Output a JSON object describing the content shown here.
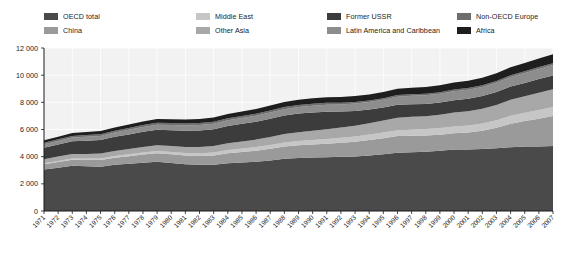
{
  "legend": {
    "items": [
      {
        "label": "OECD total",
        "color": "#4a4a4a",
        "col": 0,
        "row": 0
      },
      {
        "label": "China",
        "color": "#9a9a9a",
        "col": 0,
        "row": 1
      },
      {
        "label": "Middle East",
        "color": "#c6c6c6",
        "col": 1,
        "row": 0
      },
      {
        "label": "Other Asia",
        "color": "#a8a8a8",
        "col": 1,
        "row": 1
      },
      {
        "label": "Former USSR",
        "color": "#3c3c3c",
        "col": 2,
        "row": 0
      },
      {
        "label": "Latin America and Caribbean",
        "color": "#8d8d8d",
        "col": 2,
        "row": 1
      },
      {
        "label": "Non-OECD Europe",
        "color": "#6e6e6e",
        "col": 3,
        "row": 0
      },
      {
        "label": "Africa",
        "color": "#1e1e1e",
        "col": 3,
        "row": 1
      }
    ]
  },
  "chart_data": {
    "type": "area",
    "title": "",
    "xlabel": "",
    "ylabel": "",
    "stacked": true,
    "grid": true,
    "legend_position": "top",
    "ylim": [
      0,
      12000
    ],
    "yticks": [
      0,
      2000,
      4000,
      6000,
      8000,
      10000,
      12000
    ],
    "ytick_labels": [
      "0",
      "2 000",
      "4 000",
      "6 000",
      "8 000",
      "10 000",
      "12 000"
    ],
    "categories": [
      "1971",
      "1972",
      "1973",
      "1974",
      "1975",
      "1976",
      "1977",
      "1978",
      "1979",
      "1980",
      "1981",
      "1982",
      "1983",
      "1984",
      "1985",
      "1986",
      "1987",
      "1988",
      "1989",
      "1990",
      "1991",
      "1992",
      "1993",
      "1994",
      "1995",
      "1996",
      "1997",
      "1998",
      "1999",
      "2000",
      "2001",
      "2002",
      "2003",
      "2004",
      "2005",
      "2006",
      "2007"
    ],
    "series": [
      {
        "name": "OECD total",
        "color": "#4a4a4a",
        "values": [
          3050,
          3190,
          3330,
          3300,
          3260,
          3400,
          3470,
          3560,
          3630,
          3540,
          3450,
          3400,
          3400,
          3520,
          3570,
          3630,
          3720,
          3840,
          3900,
          3940,
          3960,
          3990,
          4020,
          4090,
          4170,
          4290,
          4330,
          4370,
          4440,
          4530,
          4530,
          4570,
          4620,
          4700,
          4740,
          4750,
          4790
        ]
      },
      {
        "name": "China",
        "color": "#9a9a9a",
        "values": [
          390,
          420,
          450,
          460,
          500,
          520,
          560,
          600,
          620,
          630,
          630,
          650,
          680,
          730,
          780,
          810,
          860,
          910,
          940,
          960,
          990,
          1030,
          1080,
          1140,
          1190,
          1230,
          1210,
          1190,
          1180,
          1200,
          1250,
          1330,
          1500,
          1720,
          1880,
          2050,
          2200
        ]
      },
      {
        "name": "Middle East",
        "color": "#c6c6c6",
        "values": [
          70,
          80,
          90,
          100,
          110,
          125,
          140,
          150,
          160,
          175,
          190,
          205,
          220,
          235,
          250,
          265,
          280,
          295,
          310,
          325,
          345,
          365,
          385,
          400,
          415,
          430,
          450,
          470,
          485,
          500,
          520,
          540,
          560,
          590,
          610,
          640,
          660
        ]
      },
      {
        "name": "Other Asia",
        "color": "#a8a8a8",
        "values": [
          300,
          315,
          330,
          340,
          355,
          375,
          390,
          410,
          425,
          435,
          450,
          465,
          485,
          505,
          525,
          550,
          580,
          615,
          650,
          685,
          720,
          755,
          795,
          835,
          880,
          920,
          950,
          950,
          980,
          1020,
          1050,
          1090,
          1130,
          1180,
          1220,
          1270,
          1310
        ]
      },
      {
        "name": "Former USSR",
        "color": "#3c3c3c",
        "values": [
          850,
          890,
          930,
          970,
          1000,
          1040,
          1080,
          1120,
          1150,
          1170,
          1190,
          1210,
          1240,
          1270,
          1290,
          1320,
          1350,
          1370,
          1370,
          1350,
          1300,
          1180,
          1090,
          1000,
          960,
          950,
          920,
          900,
          900,
          910,
          920,
          930,
          950,
          970,
          980,
          1000,
          1010
        ]
      },
      {
        "name": "Latin America and Caribbean",
        "color": "#8d8d8d",
        "values": [
          250,
          265,
          280,
          295,
          305,
          320,
          335,
          350,
          370,
          380,
          390,
          400,
          405,
          415,
          425,
          440,
          455,
          470,
          485,
          495,
          510,
          525,
          540,
          560,
          575,
          600,
          620,
          635,
          645,
          660,
          665,
          675,
          685,
          710,
          730,
          750,
          775
        ]
      },
      {
        "name": "Non-OECD Europe",
        "color": "#6e6e6e",
        "values": [
          110,
          115,
          120,
          125,
          128,
          132,
          136,
          140,
          142,
          142,
          142,
          143,
          145,
          148,
          150,
          152,
          155,
          157,
          155,
          148,
          138,
          128,
          122,
          118,
          118,
          120,
          120,
          118,
          118,
          120,
          122,
          124,
          128,
          132,
          134,
          138,
          140
        ]
      },
      {
        "name": "Africa",
        "color": "#1e1e1e",
        "values": [
          190,
          200,
          210,
          220,
          230,
          240,
          250,
          262,
          272,
          282,
          292,
          302,
          312,
          322,
          335,
          348,
          360,
          372,
          385,
          395,
          405,
          415,
          428,
          440,
          455,
          468,
          480,
          492,
          505,
          520,
          535,
          550,
          570,
          590,
          610,
          630,
          650
        ]
      }
    ]
  }
}
